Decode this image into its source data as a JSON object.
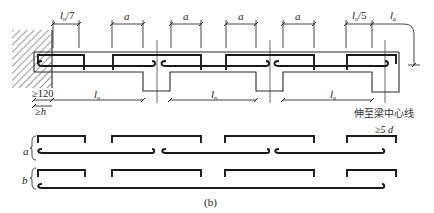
{
  "figure": {
    "caption": "(b)"
  },
  "dimensions": {
    "end_cutoff_left": {
      "main": "l",
      "sub": "n",
      "suffix": "/7"
    },
    "spacing_a": [
      "a",
      "a",
      "a",
      "a"
    ],
    "end_cutoff_right": {
      "main": "l",
      "sub": "n",
      "suffix": "/5"
    },
    "anchorage_right": {
      "main": "l",
      "sub": "a"
    },
    "support_min": "≥120",
    "support_min_h": "≥h",
    "clear_span": [
      {
        "main": "l",
        "sub": "n"
      },
      {
        "main": "l",
        "sub": "n"
      },
      {
        "main": "l",
        "sub": "n"
      }
    ],
    "hook_min": "≥5 d"
  },
  "annotations": {
    "extend_to_beam_center": "伸至梁中心线"
  },
  "bar_groups": {
    "a": {
      "label": "a"
    },
    "b": {
      "label": "b"
    }
  },
  "colors": {
    "line": "#1a1a1a",
    "background": "#ffffff"
  }
}
